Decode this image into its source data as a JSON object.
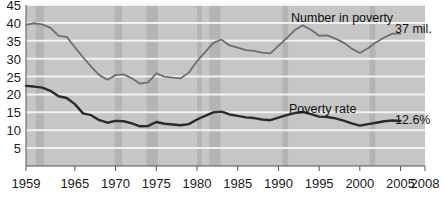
{
  "chart_data": {
    "type": "line",
    "title": "",
    "subtitle": "",
    "xlabel": "",
    "ylabel": "",
    "xlim": [
      1959,
      2008
    ],
    "ylim": [
      0,
      45
    ],
    "grid": true,
    "legend_position": "inline-annotation",
    "y_ticks": [
      5,
      10,
      15,
      20,
      25,
      30,
      35,
      40,
      45
    ],
    "y_tick_labels": [
      "5",
      "10",
      "15",
      "20",
      "25",
      "30",
      "35",
      "40",
      "45"
    ],
    "x_ticks": [
      1959,
      1965,
      1970,
      1975,
      1980,
      1985,
      1990,
      1995,
      2000,
      2005,
      2008
    ],
    "x_tick_labels": [
      "1959",
      "1965",
      "1970",
      "1975",
      "1980",
      "1985",
      "1990",
      "1995",
      "2000",
      "2005",
      "2008"
    ],
    "x": [
      1959,
      1960,
      1961,
      1962,
      1963,
      1964,
      1965,
      1966,
      1967,
      1968,
      1969,
      1970,
      1971,
      1972,
      1973,
      1974,
      1975,
      1976,
      1977,
      1978,
      1979,
      1980,
      1981,
      1982,
      1983,
      1984,
      1985,
      1986,
      1987,
      1988,
      1989,
      1990,
      1991,
      1992,
      1993,
      1994,
      1995,
      1996,
      1997,
      1998,
      1999,
      2000,
      2001,
      2002,
      2003,
      2004,
      2005
    ],
    "series": [
      {
        "name": "Number in poverty",
        "units": "millions",
        "color": "#6e6e6e",
        "end_label": "37 mil.",
        "values": [
          39.5,
          39.9,
          39.6,
          38.6,
          36.4,
          36.1,
          33.2,
          30.4,
          27.8,
          25.4,
          24.1,
          25.4,
          25.6,
          24.5,
          23.0,
          23.4,
          25.9,
          25.0,
          24.7,
          24.5,
          26.1,
          29.3,
          31.8,
          34.4,
          35.3,
          33.7,
          33.1,
          32.4,
          32.2,
          31.7,
          31.5,
          33.6,
          35.7,
          38.0,
          39.3,
          38.1,
          36.4,
          36.5,
          35.6,
          34.5,
          32.8,
          31.6,
          32.9,
          34.6,
          35.9,
          37.0,
          37.0
        ]
      },
      {
        "name": "Poverty rate",
        "units": "percent",
        "color": "#2b2b2b",
        "end_label": "12.6%",
        "values": [
          22.4,
          22.2,
          21.9,
          21.0,
          19.5,
          19.0,
          17.3,
          14.7,
          14.2,
          12.8,
          12.1,
          12.6,
          12.5,
          11.9,
          11.1,
          11.2,
          12.3,
          11.8,
          11.6,
          11.4,
          11.7,
          13.0,
          14.0,
          15.0,
          15.2,
          14.4,
          14.0,
          13.6,
          13.4,
          13.0,
          12.8,
          13.5,
          14.2,
          14.8,
          15.1,
          14.5,
          13.8,
          13.7,
          13.3,
          12.7,
          11.9,
          11.3,
          11.7,
          12.1,
          12.5,
          12.7,
          12.6
        ]
      }
    ],
    "recession_bands": [
      {
        "start": 1960.2,
        "end": 1961.2
      },
      {
        "start": 1969.9,
        "end": 1970.8
      },
      {
        "start": 1973.8,
        "end": 1975.2
      },
      {
        "start": 1980.0,
        "end": 1980.6
      },
      {
        "start": 1981.5,
        "end": 1982.9
      },
      {
        "start": 1990.5,
        "end": 1991.2
      },
      {
        "start": 2001.2,
        "end": 2001.9
      }
    ],
    "annotations": [
      {
        "id": "number-in-poverty-label",
        "text": "Number in poverty",
        "x_px": 291,
        "y_px": 22
      },
      {
        "id": "number-end-value",
        "text": "37 mil.",
        "x_px": 395,
        "y_px": 33
      },
      {
        "id": "poverty-rate-label",
        "text": "Poverty rate",
        "x_px": 289,
        "y_px": 113
      },
      {
        "id": "rate-end-value",
        "text": "12.6%",
        "x_px": 395,
        "y_px": 124
      }
    ],
    "colors": {
      "plot_background": "#c6c6c6",
      "gridline": "#f2f2f2",
      "recession_band": "#aaaaaa",
      "axis": "#555555",
      "number_line": "#6e6e6e",
      "rate_line": "#2b2b2b",
      "text": "#1a1a1a",
      "page_background": "#ffffff"
    }
  }
}
